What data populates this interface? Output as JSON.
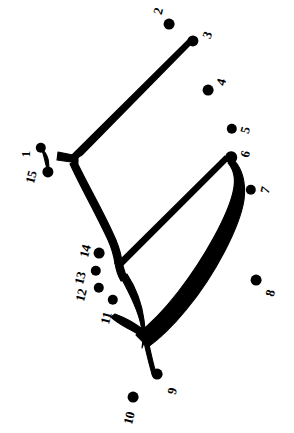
{
  "puzzle": {
    "title": "Connect the Dots",
    "type": "connect-the-dots",
    "width": 294,
    "height": 433,
    "background_color": "#ffffff",
    "ink_color": "#000000",
    "dot_count": 15,
    "dots": [
      {
        "number": "1",
        "x": 41,
        "y": 148,
        "r": 5.2,
        "label_x": 25,
        "label_y": 154,
        "label_rot": -90
      },
      {
        "number": "2",
        "x": 169,
        "y": 24,
        "r": 5.4,
        "label_x": 158,
        "label_y": 11,
        "label_rot": -75
      },
      {
        "number": "3",
        "x": 193,
        "y": 41,
        "r": 5.6,
        "label_x": 207,
        "label_y": 35,
        "label_rot": -70
      },
      {
        "number": "4",
        "x": 208,
        "y": 90,
        "r": 5.4,
        "label_x": 221,
        "label_y": 82,
        "label_rot": -75
      },
      {
        "number": "5",
        "x": 232,
        "y": 129,
        "r": 5.2,
        "label_x": 245,
        "label_y": 130,
        "label_rot": -75
      },
      {
        "number": "6",
        "x": 231,
        "y": 157,
        "r": 5.8,
        "label_x": 245,
        "label_y": 154,
        "label_rot": -75
      },
      {
        "number": "7",
        "x": 251,
        "y": 190,
        "r": 5.2,
        "label_x": 265,
        "label_y": 190,
        "label_rot": -75
      },
      {
        "number": "8",
        "x": 256,
        "y": 280,
        "r": 5.4,
        "label_x": 270,
        "label_y": 293,
        "label_rot": -75
      },
      {
        "number": "9",
        "x": 157,
        "y": 374,
        "r": 5.4,
        "label_x": 172,
        "label_y": 391,
        "label_rot": -75
      },
      {
        "number": "10",
        "x": 133,
        "y": 397,
        "r": 5.4,
        "label_x": 129,
        "label_y": 418,
        "label_rot": -75
      },
      {
        "number": "11",
        "x": 113,
        "y": 300,
        "r": 5.2,
        "label_x": 106,
        "label_y": 318,
        "label_rot": -75
      },
      {
        "number": "12",
        "x": 99,
        "y": 288,
        "r": 5.2,
        "label_x": 81,
        "label_y": 295,
        "label_rot": -75
      },
      {
        "number": "13",
        "x": 96,
        "y": 271,
        "r": 5.2,
        "label_x": 80,
        "label_y": 278,
        "label_rot": -75
      },
      {
        "number": "14",
        "x": 99,
        "y": 253,
        "r": 5.4,
        "label_x": 85,
        "label_y": 251,
        "label_rot": -75
      },
      {
        "number": "15",
        "x": 48,
        "y": 172,
        "r": 5.6,
        "label_x": 31,
        "label_y": 177,
        "label_rot": -75
      }
    ],
    "strokes": [
      {
        "name": "stroke-dot1-to-dot15-connector",
        "d": "M 41,148 C 44,154 45,163 48,172 C 50,165 49,155 41,148 Z",
        "kind": "filled-taper"
      },
      {
        "name": "stroke-dot3-to-fork-junction",
        "d": "M 193,42 L 82,155 L 74,160 L 72,155 L 190,38 Z",
        "kind": "filled-taper"
      },
      {
        "name": "stroke-fork-left-arm",
        "d": "M 58,152 L 78,156 L 78,163 L 57,160 Z",
        "kind": "filled-taper"
      },
      {
        "name": "stroke-fork-down-spine",
        "d": "M 76,160 C 86,182 104,212 116,240 C 120,250 122,258 122,264 L 115,264 C 114,256 112,249 108,240 C 96,214 80,186 70,164 Z",
        "kind": "filled-taper"
      },
      {
        "name": "stroke-spine-tail-hook",
        "d": "M 122,262 C 124,270 126,276 128,280 L 121,281 C 118,276 116,270 115,263 Z",
        "kind": "filled-taper"
      },
      {
        "name": "stroke-dot6-to-lower-left-thin",
        "d": "M 228,160 L 122,266 L 118,262 L 225,156 Z",
        "kind": "filled-taper"
      },
      {
        "name": "stroke-dot6-thick-sweep-down",
        "d": "M 234,160 C 243,170 246,184 244,200 C 240,226 216,274 186,310 C 172,327 158,340 148,347 L 136,335 C 148,326 164,310 178,292 C 206,256 228,214 233,192 C 236,180 234,170 228,163 Z",
        "kind": "filled-taper"
      },
      {
        "name": "stroke-lower-crescent-arc",
        "d": "M 127,274 C 136,288 142,304 144,320 C 146,332 145,342 142,348 C 144,336 141,320 134,304 C 129,292 123,282 121,277 Z",
        "kind": "filled-taper"
      },
      {
        "name": "stroke-lower-left-whisker",
        "d": "M 115,314 C 126,318 137,324 146,332 C 150,336 152,340 152,343 C 146,339 137,333 127,328 C 120,324 114,320 111,317 Z",
        "kind": "filled-taper"
      },
      {
        "name": "stroke-lower-tail-to-dot9",
        "d": "M 146,330 C 149,344 152,360 156,373 L 152,374 C 148,360 144,344 142,331 Z",
        "kind": "filled-taper"
      }
    ]
  }
}
